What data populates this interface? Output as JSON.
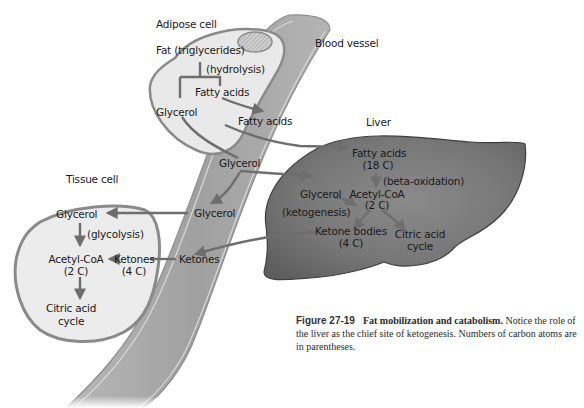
{
  "diagram": {
    "compartments": {
      "adipose_cell": "Adipose cell",
      "blood_vessel": "Blood vessel",
      "liver": "Liver",
      "tissue_cell": "Tissue cell"
    },
    "adipose": {
      "fat": "Fat (triglycerides)",
      "hydrolysis": "(hydrolysis)",
      "fatty_acids": "Fatty acids",
      "glycerol": "Glycerol"
    },
    "blood": {
      "fatty_acids": "Fatty acids",
      "glycerol_upper": "Glycerol",
      "glycerol_lower": "Glycerol",
      "ketones": "Ketones"
    },
    "liver": {
      "fatty_acids": "Fatty acids",
      "fatty_acids_carbons": "(18 C)",
      "beta_oxidation": "(beta-oxidation)",
      "glycerol": "Glycerol",
      "acetyl_coa": "Acetyl-CoA",
      "acetyl_coa_carbons": "(2 C)",
      "ketogenesis": "(ketogenesis)",
      "ketone_bodies": "Ketone bodies",
      "ketone_bodies_carbons": "(4 C)",
      "citric_acid_cycle_1": "Citric acid",
      "citric_acid_cycle_2": "cycle"
    },
    "tissue": {
      "glycerol": "Glycerol",
      "glycolysis": "(glycolysis)",
      "acetyl_coa": "Acetyl-CoA",
      "acetyl_coa_carbons": "(2 C)",
      "ketones": "Ketones",
      "ketones_carbons": "(4 C)",
      "citric_acid_cycle_1": "Citric acid",
      "citric_acid_cycle_2": "cycle"
    },
    "colors": {
      "liver_fill": "#7a7a7a",
      "liver_dark": "#5a5a5a",
      "cell_fill": "#e8e8e8",
      "cell_border": "#8a8a8a",
      "vessel_fill": "#a8a8a8",
      "arrow": "#6e6e6e"
    }
  },
  "caption": {
    "figure_number": "Figure 27-19",
    "title": "Fat mobilization and catabolism.",
    "body": "Notice the role of the liver as the chief site of ketogenesis. Numbers of carbon atoms are in parentheses."
  }
}
